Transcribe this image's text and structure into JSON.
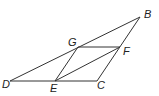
{
  "diagram": {
    "points": {
      "B": {
        "label": "B",
        "x": 140,
        "y": 17
      },
      "G": {
        "label": "G",
        "x": 78,
        "y": 47
      },
      "F": {
        "label": "F",
        "x": 120,
        "y": 47
      },
      "D": {
        "label": "D",
        "x": 10,
        "y": 81
      },
      "E": {
        "label": "E",
        "x": 55,
        "y": 81
      },
      "C": {
        "label": "C",
        "x": 97,
        "y": 81
      }
    },
    "segments": [
      "DB",
      "DC",
      "CB",
      "GF",
      "GE",
      "EF"
    ]
  }
}
